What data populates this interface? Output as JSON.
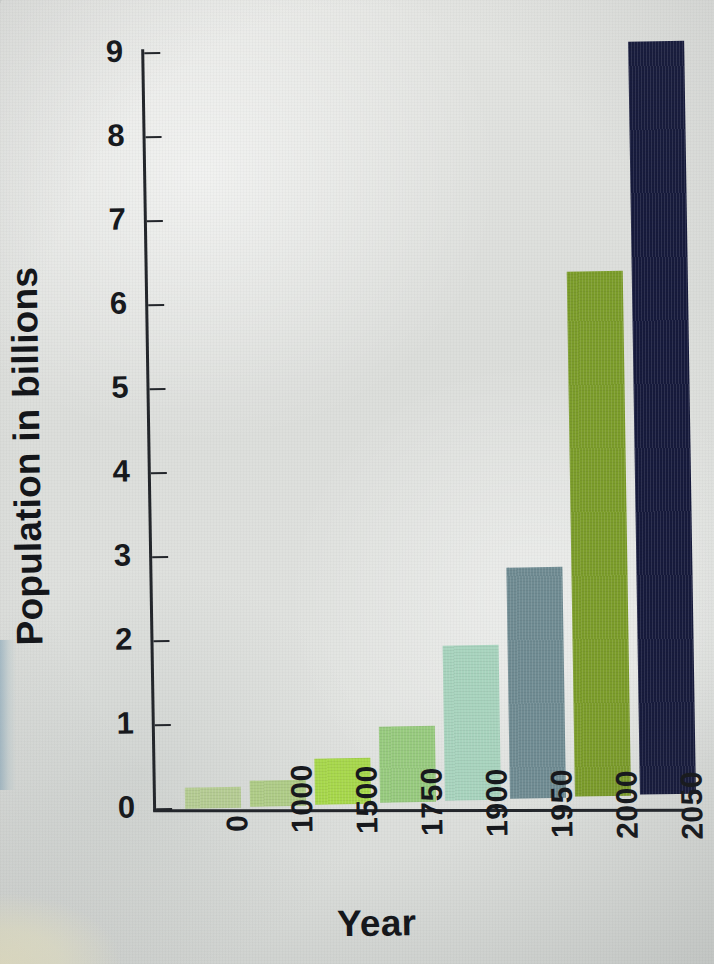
{
  "chart_data": {
    "type": "bar",
    "title": "",
    "xlabel": "Year",
    "ylabel": "Population in billions",
    "categories": [
      "0",
      "1000",
      "1500",
      "1750",
      "1900",
      "1950",
      "2000",
      "2050"
    ],
    "values": [
      0.25,
      0.31,
      0.55,
      0.9,
      1.85,
      2.75,
      6.25,
      9.3
    ],
    "ylim": [
      0,
      9
    ],
    "yticks": [
      "0",
      "1",
      "2",
      "3",
      "4",
      "5",
      "6",
      "7",
      "8",
      "9"
    ],
    "grid": false,
    "legend": "none",
    "bar_colors": [
      "#b4cb92",
      "#aecb86",
      "#a6d74a",
      "#97ca7e",
      "#a7d3bd",
      "#6f8b92",
      "#7b9c2a",
      "#161a3c"
    ],
    "axis_color": "#23262b",
    "background_color": "#e0e2df",
    "note": "Bar heights read against the 0-9 axis; 2050 bar extends past the top of the visible frame."
  },
  "axis": {
    "y_title": "Population in billions",
    "x_title": "Year"
  }
}
